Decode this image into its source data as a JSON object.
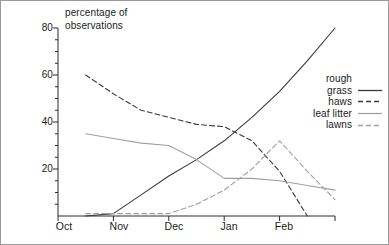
{
  "figure": {
    "frame_border_color": "#9a9a9a",
    "background": "#ffffff"
  },
  "axes": {
    "y_axis_title_line1": "percentage of",
    "y_axis_title_line2": "observations",
    "y_tick_labels": [
      "20",
      "40",
      "60",
      "80"
    ],
    "x_tick_labels": [
      "Oct",
      "Nov",
      "Dec",
      "Jan",
      "Feb"
    ]
  },
  "legend": {
    "entries": [
      {
        "label_line1": "rough",
        "label_line2": "grass",
        "style": "solid",
        "color": "#3a3a3a",
        "name": "rough-grass"
      },
      {
        "label_line1": "haws",
        "label_line2": "",
        "style": "dashed",
        "color": "#3a3a3a",
        "name": "haws"
      },
      {
        "label_line1": "leaf litter",
        "label_line2": "",
        "style": "solid",
        "color": "#a0a0a0",
        "name": "leaf-litter"
      },
      {
        "label_line1": "lawns",
        "label_line2": "",
        "style": "dashed",
        "color": "#a0a0a0",
        "name": "lawns"
      }
    ]
  },
  "chart_data": {
    "type": "line",
    "title": "",
    "xlabel": "",
    "ylabel": "percentage of observations",
    "xlim": [
      0,
      5
    ],
    "ylim": [
      0,
      80
    ],
    "grid": false,
    "legend_position": "right",
    "x_tick_labels": [
      "Oct",
      "Nov",
      "Dec",
      "Jan",
      "Feb"
    ],
    "y_ticks": [
      20,
      40,
      60,
      80
    ],
    "y_minor_tick_step": 5,
    "x": [
      0.5,
      1.0,
      1.5,
      2.0,
      2.5,
      3.0,
      3.5,
      4.0,
      4.5,
      5.0
    ],
    "series": [
      {
        "name": "rough grass",
        "style": "solid",
        "color": "#3a3a3a",
        "values": [
          0,
          1,
          9,
          17,
          24,
          32,
          42,
          53,
          66,
          80
        ]
      },
      {
        "name": "haws",
        "style": "dashed",
        "color": "#3a3a3a",
        "values": [
          60,
          52,
          45,
          42,
          39,
          38,
          32,
          19,
          0,
          null
        ]
      },
      {
        "name": "leaf litter",
        "style": "solid",
        "color": "#a0a0a0",
        "values": [
          35,
          33,
          31,
          30,
          24,
          16,
          16,
          15,
          13,
          11
        ]
      },
      {
        "name": "lawns",
        "style": "dashed",
        "color": "#a0a0a0",
        "values": [
          1,
          1,
          1,
          1,
          5,
          11,
          20,
          32,
          19,
          7
        ]
      }
    ]
  }
}
